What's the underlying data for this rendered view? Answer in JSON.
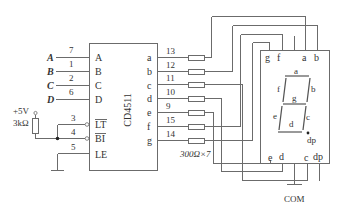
{
  "diagram": {
    "ic": {
      "name": "CD4511",
      "inputs": [
        {
          "signal": "A",
          "pin": "A",
          "pin_no": "7"
        },
        {
          "signal": "B",
          "pin": "B",
          "pin_no": "1"
        },
        {
          "signal": "C",
          "pin": "C",
          "pin_no": "2"
        },
        {
          "signal": "D",
          "pin": "D",
          "pin_no": "6"
        }
      ],
      "control_pins": [
        {
          "pin": "LT",
          "pin_no": "3"
        },
        {
          "pin": "BI",
          "pin_no": "4"
        },
        {
          "pin": "LE",
          "pin_no": "5"
        }
      ],
      "outputs": [
        {
          "pin": "a",
          "pin_no": "13"
        },
        {
          "pin": "b",
          "pin_no": "12"
        },
        {
          "pin": "c",
          "pin_no": "11"
        },
        {
          "pin": "d",
          "pin_no": "10"
        },
        {
          "pin": "e",
          "pin_no": "9"
        },
        {
          "pin": "f",
          "pin_no": "15"
        },
        {
          "pin": "g",
          "pin_no": "14"
        }
      ]
    },
    "pullup": {
      "supply": "+5V",
      "resistor": "3kΩ"
    },
    "resistor_array": {
      "label": "300Ω×7"
    },
    "display": {
      "top_pins": [
        "g",
        "f",
        "a",
        "b"
      ],
      "bottom_pins": [
        "e",
        "d",
        "c",
        "dp"
      ],
      "segments": [
        "a",
        "b",
        "c",
        "d",
        "e",
        "f",
        "g",
        "dp"
      ],
      "common_label": "COM"
    }
  }
}
